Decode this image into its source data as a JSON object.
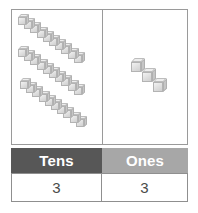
{
  "diagram": {
    "type": "place-value-base-ten-blocks",
    "number_represented": 33,
    "panels": {
      "tens": {
        "label": "tens-blocks-panel",
        "rod_count": 3,
        "cubes_per_rod": 10,
        "rods": [
          {
            "start_x": 6,
            "start_y": 4
          },
          {
            "start_x": 6,
            "start_y": 36
          },
          {
            "start_x": 8,
            "start_y": 68
          }
        ],
        "step_x": 6.2,
        "step_y": 4.2
      },
      "ones": {
        "label": "ones-blocks-panel",
        "cube_count": 3,
        "cubes": [
          {
            "x": 28,
            "y": 48
          },
          {
            "x": 39,
            "y": 58
          },
          {
            "x": 50,
            "y": 68
          }
        ]
      }
    }
  },
  "table": {
    "name": "place-value-table",
    "headers": [
      {
        "label": "Tens",
        "bg": "#575757"
      },
      {
        "label": "Ones",
        "bg": "#a7a7a7"
      }
    ],
    "values": [
      {
        "label": "3"
      },
      {
        "label": "3"
      }
    ]
  },
  "colors": {
    "header_tens_bg": "#575757",
    "header_ones_bg": "#a7a7a7",
    "header_text": "#ffffff",
    "value_text": "#4a4a4a",
    "border": "#8f8f8f",
    "panel_border": "#9a9a9a",
    "cube_light": "#f2f2f2",
    "cube_mid": "#dedede",
    "cube_dark": "#c6c6c6",
    "background": "#ffffff"
  }
}
